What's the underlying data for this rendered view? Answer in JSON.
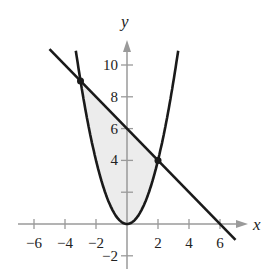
{
  "chart_data": {
    "type": "line",
    "title": "",
    "xlabel": "x",
    "ylabel": "y",
    "xlim": [
      -7,
      7.5
    ],
    "ylim": [
      -3,
      11
    ],
    "x_ticks": [
      -6,
      -4,
      -2,
      2,
      4,
      6
    ],
    "y_ticks": [
      -2,
      2,
      4,
      6,
      8,
      10
    ],
    "x_tick_labels": [
      "−6",
      "−4",
      "−2",
      "2",
      "4",
      "6"
    ],
    "y_tick_labels": [
      "−2",
      "",
      "4",
      "6",
      "8",
      "10"
    ],
    "grid": false,
    "series": [
      {
        "name": "parabola",
        "equation": "y = x^2",
        "x_range": [
          -3.3,
          3.3
        ]
      },
      {
        "name": "line",
        "equation": "y = 6 - x",
        "x_range": [
          -5,
          7
        ]
      }
    ],
    "intersections": [
      {
        "x": -3,
        "y": 9
      },
      {
        "x": 2,
        "y": 4
      }
    ],
    "shaded_region": {
      "between": [
        "line",
        "parabola"
      ],
      "x_range": [
        -3,
        2
      ],
      "color": "#ececec"
    },
    "colors": {
      "curve": "#1a1a1a",
      "axis": "#9a9a9a",
      "fill": "#ececec"
    }
  }
}
